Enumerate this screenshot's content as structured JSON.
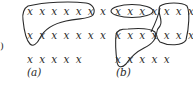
{
  "edge_fragment": ")",
  "panel_a": {
    "label": "(a)",
    "rows": [
      "x x x x x x x",
      "x x x x x x x",
      "x x x x x"
    ],
    "enclosure": "closed loop around all of row 1 and the first three x's of row 2"
  },
  "panel_b": {
    "label": "(b)",
    "rows": [
      "x x x x x x x",
      "x x x x x x x",
      "x x x x x"
    ],
    "enclosures": [
      "ellipse around first five x's of row 1",
      "loop around last two x's of row 1 and last three x's of row 2",
      "loop around first four x's of row 2 and first x of row 3"
    ]
  }
}
